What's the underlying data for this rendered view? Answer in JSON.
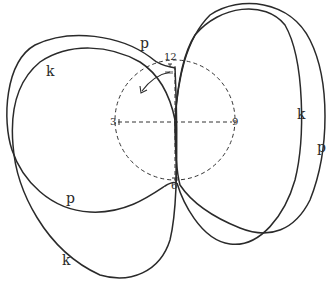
{
  "diagram": {
    "clock_circle": {
      "cx": 175,
      "cy": 120,
      "r": 60
    },
    "clock_labels": {
      "twelve": "12",
      "three": "3",
      "six": "6",
      "nine": "9"
    },
    "curve_labels": {
      "p_top_left": "p",
      "k_top_left": "k",
      "p_bottom_left": "p",
      "k_bottom_left": "k",
      "k_right": "k",
      "p_right": "p"
    },
    "colors": {
      "stroke": "#2a2a2a",
      "background": "#ffffff"
    }
  }
}
